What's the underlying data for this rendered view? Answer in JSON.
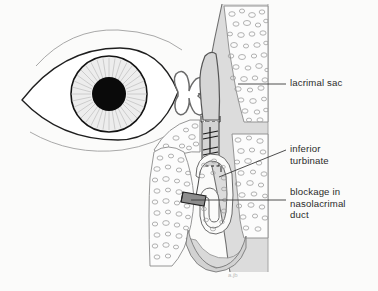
{
  "figure": {
    "width": 378,
    "height": 291,
    "background_color": "#fbfbfa",
    "signature": "a.jb"
  },
  "labels": [
    {
      "id": "lacrimal-sac",
      "text": "lacrimal sac",
      "leader": {
        "type": "horizontal",
        "x1": 238,
        "y1": 84,
        "x2": 286,
        "y2": 84
      }
    },
    {
      "id": "inferior-turbinate",
      "text": "inferior\nturbinate",
      "leader": {
        "type": "diagonal",
        "x1": 219,
        "y1": 176,
        "x2": 286,
        "y2": 150
      }
    },
    {
      "id": "blockage",
      "text": "blockage in\nnasolacrimal\nduct",
      "leader": {
        "type": "horizontal",
        "x1": 191,
        "y1": 200,
        "x2": 286,
        "y2": 200
      }
    }
  ],
  "structures": {
    "eye": {
      "name": "eye",
      "iris_fill": "#ededed",
      "iris_stroke": "#1a1a1a",
      "pupil_fill": "#0a0a0a",
      "sclera_fill": "#ffffff",
      "lid_stroke": "#2a2a2a",
      "crease_stroke": "#8d8d8d"
    },
    "canaliculi": {
      "name": "lacrimal-canaliculi",
      "fill": "#ffffff",
      "stroke": "#6b6b6b"
    },
    "lacrimal_sac": {
      "name": "lacrimal-sac",
      "fill": "#d7d7d7",
      "stroke": "#5a5a5a"
    },
    "nasolacrimal_duct": {
      "name": "nasolacrimal-duct",
      "fill": "#d3d3d3",
      "stroke": "#4a4a4a",
      "break_marks": 2
    },
    "blockage": {
      "name": "duct-blockage",
      "fill": "#8a8a8a",
      "stroke": "#2a2a2a"
    },
    "inferior_turbinate": {
      "name": "inferior-turbinate",
      "fill": "#fbfbfa",
      "stroke": "#6b6b6b"
    },
    "bone": {
      "name": "cancellous-bone",
      "fill": "#fcfcfc",
      "stroke": "#8a8a8a",
      "stipple_color": "#9a9a9a"
    },
    "nasal_cavity": {
      "name": "nasal-cavity-soft-tissue",
      "fill": "#d9d9d9",
      "stroke": "#6f6f6f"
    }
  }
}
